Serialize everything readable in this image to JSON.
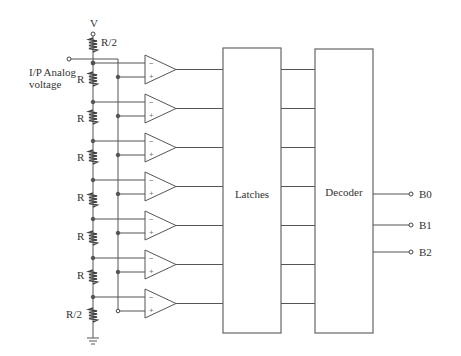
{
  "diagram": {
    "supply_label": "V",
    "input_label_line1": "I/P Analog",
    "input_label_line2": "voltage",
    "resistors": [
      "R/2",
      "R",
      "R",
      "R",
      "R",
      "R",
      "R",
      "R/2"
    ],
    "comparator_count": 7,
    "comparator_minus": "−",
    "comparator_plus": "+",
    "latches_label": "Latches",
    "decoder_label": "Decoder",
    "outputs": [
      "B0",
      "B1",
      "B2"
    ],
    "colors": {
      "line": "#555555",
      "background": "#ffffff",
      "text": "#333333"
    }
  }
}
